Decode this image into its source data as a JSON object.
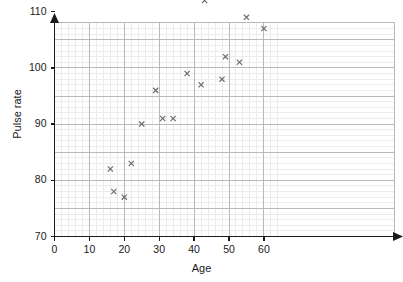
{
  "chart_data": {
    "type": "scatter",
    "title": "",
    "xlabel": "Age",
    "ylabel": "Pulse rate",
    "xlim": [
      0,
      64
    ],
    "ylim": [
      70,
      114
    ],
    "xticks": [
      0,
      10,
      20,
      30,
      40,
      50,
      60
    ],
    "yticks": [
      70,
      80,
      90,
      100,
      110
    ],
    "x_major_gridline_step": 10,
    "x_minor_gridline_step": 2,
    "y_major_gridline_step": 5,
    "y_minor_gridline_step": 1,
    "grid": true,
    "legend": null,
    "marker": "x",
    "marker_color": "#6b6b6b",
    "axis_color": "#1a1a1a",
    "major_grid_color": "#b9b9b9",
    "minor_grid_color": "#ececec",
    "points": [
      {
        "x": 16,
        "y": 82
      },
      {
        "x": 17,
        "y": 78
      },
      {
        "x": 20,
        "y": 77
      },
      {
        "x": 22,
        "y": 83
      },
      {
        "x": 25,
        "y": 90
      },
      {
        "x": 29,
        "y": 96
      },
      {
        "x": 31,
        "y": 91
      },
      {
        "x": 34,
        "y": 91
      },
      {
        "x": 38,
        "y": 99
      },
      {
        "x": 42,
        "y": 97
      },
      {
        "x": 43,
        "y": 112
      },
      {
        "x": 48,
        "y": 98
      },
      {
        "x": 49,
        "y": 102
      },
      {
        "x": 53,
        "y": 101
      },
      {
        "x": 55,
        "y": 109
      },
      {
        "x": 60,
        "y": 107
      }
    ]
  },
  "axes": {
    "x_tick_labels": [
      "0",
      "10",
      "20",
      "30",
      "40",
      "50",
      "60"
    ],
    "y_tick_labels": [
      "70",
      "80",
      "90",
      "100",
      "110"
    ],
    "x_axis_title": "Age",
    "y_axis_title": "Pulse rate"
  }
}
